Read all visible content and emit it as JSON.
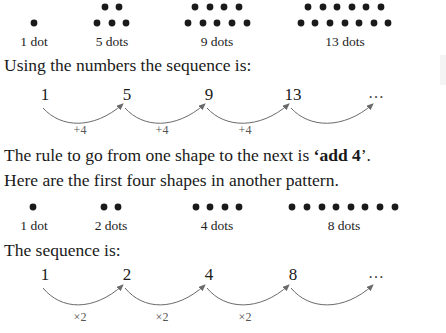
{
  "pattern1": {
    "shapes": [
      {
        "label": "1 dot",
        "label_x": 34,
        "rows": [
          {
            "y": 23,
            "xs": [
              34
            ]
          }
        ]
      },
      {
        "label": "5 dots",
        "label_x": 112,
        "rows": [
          {
            "y": 7,
            "xs": [
              105,
              119
            ]
          },
          {
            "y": 23,
            "xs": [
              97,
              112,
              126
            ]
          }
        ]
      },
      {
        "label": "9 dots",
        "label_x": 217,
        "rows": [
          {
            "y": 7,
            "xs": [
              195,
              210,
              224,
              239
            ]
          },
          {
            "y": 23,
            "xs": [
              188,
              203,
              217,
              232,
              247
            ]
          }
        ]
      },
      {
        "label": "13 dots",
        "label_x": 345,
        "rows": [
          {
            "y": 7,
            "xs": [
              308,
              323,
              337,
              352,
              366,
              381
            ]
          },
          {
            "y": 23,
            "xs": [
              301,
              315,
              330,
              345,
              359,
              374,
              388
            ]
          }
        ]
      }
    ],
    "label_top": 34
  },
  "text": {
    "intro1": "Using the numbers the sequence is:",
    "rule_prefix": "The rule to go from one shape to the next is ",
    "rule_bold": "‘add 4",
    "rule_suffix": "’.",
    "intro2": "Here are the first four shapes in another pattern.",
    "intro3": "The sequence is:"
  },
  "sequence1": {
    "terms": [
      "1",
      "5",
      "9",
      "13"
    ],
    "ellipsis": "…",
    "term_xs": [
      45,
      127,
      209,
      293
    ],
    "ellipsis_x": 377,
    "term_top": 85,
    "arc_labels": [
      "+4",
      "+4",
      "+4",
      ""
    ],
    "arc_y_start": 108,
    "arc_y_end": 104,
    "arc_depth": 124,
    "label_top": 123
  },
  "pattern2": {
    "shapes": [
      {
        "label": "1 dot",
        "label_x": 34,
        "rows": [
          {
            "y": 207,
            "xs": [
              33
            ]
          }
        ]
      },
      {
        "label": "2 dots",
        "label_x": 111,
        "rows": [
          {
            "y": 207,
            "xs": [
              104,
              118
            ]
          }
        ]
      },
      {
        "label": "4 dots",
        "label_x": 217,
        "rows": [
          {
            "y": 207,
            "xs": [
              196,
              210,
              225,
              239
            ]
          }
        ]
      },
      {
        "label": "8 dots",
        "label_x": 344,
        "rows": [
          {
            "y": 207,
            "xs": [
              292,
              307,
              322,
              336,
              351,
              365,
              380,
              395
            ]
          }
        ]
      }
    ],
    "label_top": 218
  },
  "sequence2": {
    "terms": [
      "1",
      "2",
      "4",
      "8"
    ],
    "ellipsis": "…",
    "term_xs": [
      45,
      127,
      209,
      293
    ],
    "ellipsis_x": 377,
    "term_top": 265,
    "arc_labels": [
      "×2",
      "×2",
      "×2",
      ""
    ],
    "arc_y_start": 288,
    "arc_y_end": 285,
    "arc_depth": 306,
    "label_top": 310
  },
  "colors": {
    "dot": "#1a1a1a",
    "arc": "#6a6a6a",
    "text": "#1a1a1a"
  }
}
